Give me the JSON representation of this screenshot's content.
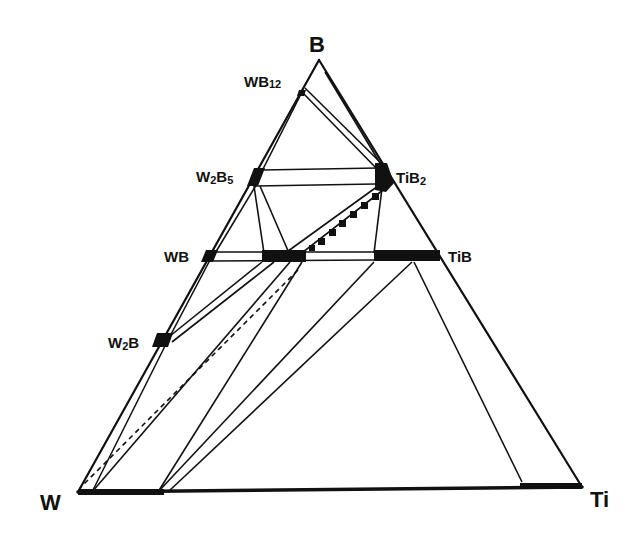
{
  "diagram": {
    "type": "ternary-phase-diagram",
    "system": "W-Ti-B",
    "corners": {
      "top": "B",
      "left": "W",
      "right": "Ti"
    },
    "phases": [
      {
        "id": "wb12",
        "label_main": "WB",
        "label_sub": "12"
      },
      {
        "id": "w2b5",
        "label_main": "W",
        "label_sub1": "2",
        "label_main2": "B",
        "label_sub2": "5"
      },
      {
        "id": "tib2",
        "label_main": "TiB",
        "label_sub": "2"
      },
      {
        "id": "wb",
        "label_main": "WB"
      },
      {
        "id": "tib",
        "label_main": "TiB"
      },
      {
        "id": "w2b",
        "label_main": "W",
        "label_sub1": "2",
        "label_main2": "B"
      }
    ],
    "colors": {
      "line": "#111111",
      "background": "#ffffff"
    }
  }
}
